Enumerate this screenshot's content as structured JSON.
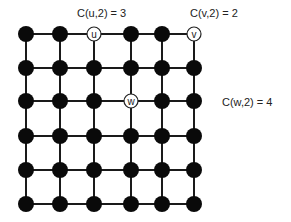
{
  "diagram": {
    "type": "grid-graph",
    "rows": 6,
    "cols": 6,
    "col_x": [
      26,
      60,
      94,
      131,
      162,
      194
    ],
    "row_y": [
      34,
      68,
      101,
      136,
      170,
      204
    ],
    "node_radius": 8,
    "edge_color": "#1a1a1a",
    "node_fill": "#0a0a0a",
    "highlight_fill": "#ffffff",
    "highlight_stroke": "#222222",
    "labeled_nodes": [
      {
        "id": "u",
        "label": "u",
        "row": 0,
        "col": 2
      },
      {
        "id": "v",
        "label": "v",
        "row": 0,
        "col": 5
      },
      {
        "id": "w",
        "label": "w",
        "row": 2,
        "col": 3
      }
    ]
  },
  "annotations": [
    {
      "id": "cu",
      "text": "C(u,2) = 3",
      "x": 77,
      "y": 17
    },
    {
      "id": "cv",
      "text": "C(v,2) = 2",
      "x": 190,
      "y": 17
    },
    {
      "id": "cw",
      "text": "C(w,2) = 4",
      "x": 222,
      "y": 106
    }
  ]
}
